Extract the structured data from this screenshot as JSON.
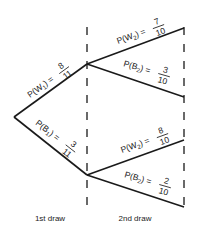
{
  "colors": {
    "line": "#1a1a1a",
    "text": "#222222",
    "background": "#ffffff"
  },
  "stages": [
    {
      "label": "1st draw"
    },
    {
      "label": "2nd draw"
    }
  ],
  "first_draw": {
    "upper": {
      "event": "P(W",
      "sub": "1",
      "close": ") =",
      "num": "8",
      "den": "11"
    },
    "lower": {
      "event": "P(B",
      "sub": "1",
      "close": ") =",
      "num": "3",
      "den": "11"
    }
  },
  "second_draw": {
    "upper_top": {
      "event": "P(W",
      "sub": "2",
      "close": ") =",
      "num": "7",
      "den": "10"
    },
    "upper_bottom": {
      "event": "P(B",
      "sub": "2",
      "close": ") =",
      "num": "3",
      "den": "10"
    },
    "lower_top": {
      "event": "P(W",
      "sub": "2",
      "close": ") =",
      "num": "8",
      "den": "10"
    },
    "lower_bottom": {
      "event": "P(B",
      "sub": "2",
      "close": ") =",
      "num": "2",
      "den": "10"
    }
  }
}
